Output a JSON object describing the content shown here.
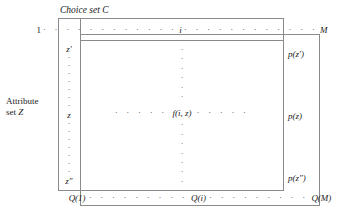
{
  "figure": {
    "title": "Choice set C",
    "attribute_caption_line1": "Attribute",
    "attribute_caption_line2": "set Z",
    "background_color": "#ffffff",
    "line_color": "#8a8a8a",
    "text_color": "#1a1a1a",
    "dot_color": "#4a4a4a"
  },
  "choice_index_row": {
    "first": "1",
    "middle": "i",
    "last": "M",
    "dots_left": "· · · · · · · · · · · ·",
    "dots_right": "· · · · · · · · · · · ·"
  },
  "attribute_labels": {
    "first": "z′",
    "middle": "z",
    "last": "z″"
  },
  "matrix": {
    "center_entry": "f(i, z)",
    "dots_left": "· · · · ·",
    "dots_right": "· · · · ·"
  },
  "probability_labels": {
    "first": "p(z′)",
    "middle": "p(z)",
    "last": "p(z″)"
  },
  "q_row": {
    "first": "Q(1)",
    "middle": "Q(i)",
    "last": "Q(M)",
    "dots_left": "· · · · · · · · ·",
    "dots_right": "· · · · · · · · ·"
  }
}
